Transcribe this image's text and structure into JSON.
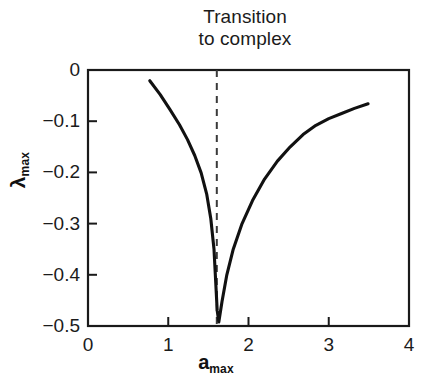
{
  "figure": {
    "title_lines": [
      "Transition",
      "to complex"
    ],
    "background_color": "#ffffff",
    "axis_color": "#1a1a1a",
    "curve_color": "#111111",
    "marker_line_color": "#3a3a3a"
  },
  "chart_data": {
    "type": "line",
    "title": "Transition to complex",
    "xlabel": "a_max",
    "ylabel": "λ_max",
    "xlabel_base": "a",
    "xlabel_sub": "max",
    "ylabel_base": "λ",
    "ylabel_sub": "max",
    "xlim": [
      0,
      4
    ],
    "ylim": [
      -0.5,
      0
    ],
    "grid": false,
    "legend": "none",
    "xticks": [
      0,
      1,
      2,
      3,
      4
    ],
    "xtick_labels": [
      "0",
      "1",
      "2",
      "3",
      "4"
    ],
    "yticks": [
      0,
      -0.1,
      -0.2,
      -0.3,
      -0.4,
      -0.5
    ],
    "ytick_labels": [
      "0",
      "−0.1",
      "−0.2",
      "−0.3",
      "−0.4",
      "−0.5"
    ],
    "series": [
      {
        "name": "lambda_max",
        "x": [
          0.77,
          0.9,
          1.02,
          1.14,
          1.24,
          1.33,
          1.41,
          1.48,
          1.53,
          1.57,
          1.59,
          1.61,
          1.63,
          1.67,
          1.73,
          1.81,
          1.92,
          2.05,
          2.2,
          2.36,
          2.52,
          2.68,
          2.84,
          3.0,
          3.16,
          3.32,
          3.49
        ],
        "y": [
          -0.021,
          -0.048,
          -0.077,
          -0.107,
          -0.136,
          -0.167,
          -0.201,
          -0.243,
          -0.29,
          -0.35,
          -0.41,
          -0.47,
          -0.492,
          -0.452,
          -0.4,
          -0.35,
          -0.3,
          -0.255,
          -0.213,
          -0.178,
          -0.15,
          -0.126,
          -0.108,
          -0.095,
          -0.085,
          -0.075,
          -0.066
        ]
      }
    ],
    "annotations": [
      {
        "type": "vertical-dashed-line",
        "label": "Transition to complex",
        "x": 1.605,
        "y_from": 0,
        "y_to": -0.5
      }
    ],
    "minimum_point": {
      "x": 1.62,
      "y": -0.492
    }
  }
}
